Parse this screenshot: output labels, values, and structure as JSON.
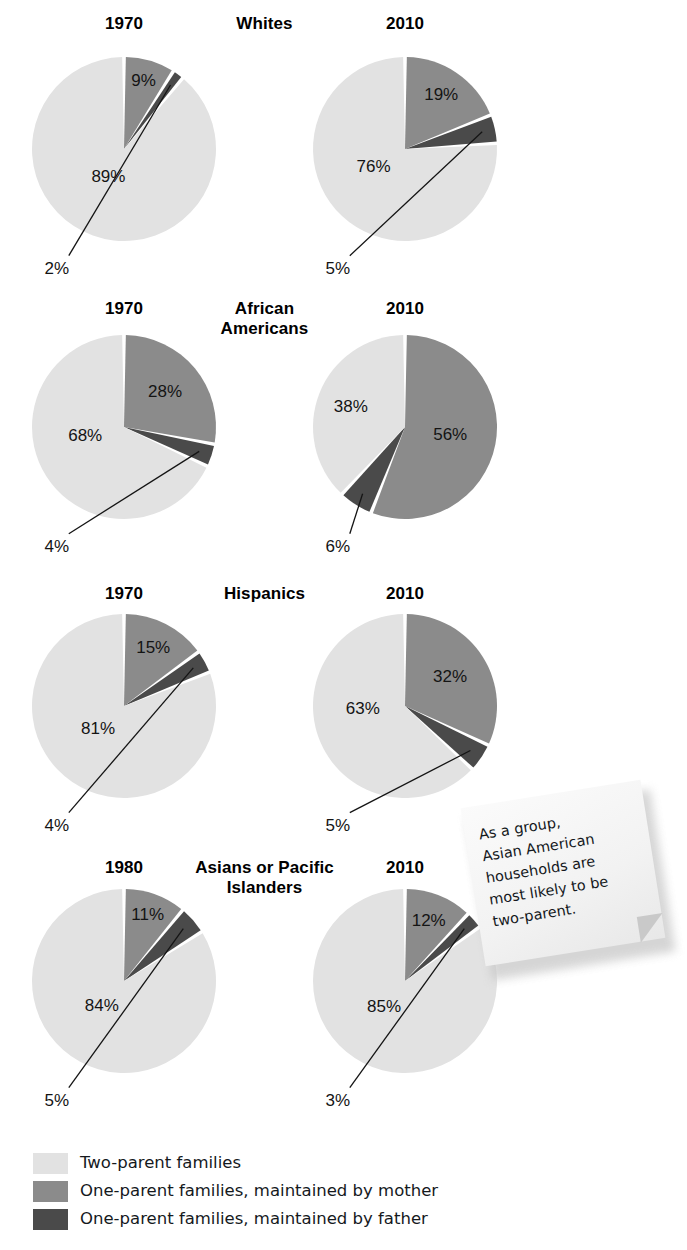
{
  "chart_data": {
    "type": "pie",
    "title": "",
    "legend_position": "bottom-left",
    "series_names": [
      "Two-parent families",
      "One-parent families, maintained by mother",
      "One-parent families, maintained by father"
    ],
    "colors": {
      "two_parent": "#e2e2e2",
      "mother": "#8b8b8b",
      "father": "#4a4a4a",
      "separator": "#ffffff",
      "text": "#141414"
    },
    "units": "percent",
    "rows": [
      {
        "group": "Whites",
        "charts": [
          {
            "year": "1970",
            "slices": [
              {
                "name": "Two-parent families",
                "value": 89,
                "label": "89%",
                "color_key": "two_parent",
                "callout": false
              },
              {
                "name": "One-parent families, maintained by mother",
                "value": 9,
                "label": "9%",
                "color_key": "mother",
                "callout": false
              },
              {
                "name": "One-parent families, maintained by father",
                "value": 2,
                "label": "2%",
                "color_key": "father",
                "callout": true
              }
            ]
          },
          {
            "year": "2010",
            "slices": [
              {
                "name": "Two-parent families",
                "value": 76,
                "label": "76%",
                "color_key": "two_parent",
                "callout": false
              },
              {
                "name": "One-parent families, maintained by mother",
                "value": 19,
                "label": "19%",
                "color_key": "mother",
                "callout": false
              },
              {
                "name": "One-parent families, maintained by father",
                "value": 5,
                "label": "5%",
                "color_key": "father",
                "callout": true
              }
            ]
          }
        ]
      },
      {
        "group": "African\nAmericans",
        "charts": [
          {
            "year": "1970",
            "slices": [
              {
                "name": "Two-parent families",
                "value": 68,
                "label": "68%",
                "color_key": "two_parent",
                "callout": false
              },
              {
                "name": "One-parent families, maintained by mother",
                "value": 28,
                "label": "28%",
                "color_key": "mother",
                "callout": false
              },
              {
                "name": "One-parent families, maintained by father",
                "value": 4,
                "label": "4%",
                "color_key": "father",
                "callout": true
              }
            ]
          },
          {
            "year": "2010",
            "slices": [
              {
                "name": "Two-parent families",
                "value": 38,
                "label": "38%",
                "color_key": "two_parent",
                "callout": false
              },
              {
                "name": "One-parent families, maintained by mother",
                "value": 56,
                "label": "56%",
                "color_key": "mother",
                "callout": false
              },
              {
                "name": "One-parent families, maintained by father",
                "value": 6,
                "label": "6%",
                "color_key": "father",
                "callout": true
              }
            ]
          }
        ]
      },
      {
        "group": "Hispanics",
        "charts": [
          {
            "year": "1970",
            "slices": [
              {
                "name": "Two-parent families",
                "value": 81,
                "label": "81%",
                "color_key": "two_parent",
                "callout": false
              },
              {
                "name": "One-parent families, maintained by mother",
                "value": 15,
                "label": "15%",
                "color_key": "mother",
                "callout": false
              },
              {
                "name": "One-parent families, maintained by father",
                "value": 4,
                "label": "4%",
                "color_key": "father",
                "callout": true
              }
            ]
          },
          {
            "year": "2010",
            "slices": [
              {
                "name": "Two-parent families",
                "value": 63,
                "label": "63%",
                "color_key": "two_parent",
                "callout": false
              },
              {
                "name": "One-parent families, maintained by mother",
                "value": 32,
                "label": "32%",
                "color_key": "mother",
                "callout": false
              },
              {
                "name": "One-parent families, maintained by father",
                "value": 5,
                "label": "5%",
                "color_key": "father",
                "callout": true
              }
            ]
          }
        ]
      },
      {
        "group": "Asians or Pacific\nIslanders",
        "charts": [
          {
            "year": "1980",
            "slices": [
              {
                "name": "Two-parent families",
                "value": 84,
                "label": "84%",
                "color_key": "two_parent",
                "callout": false
              },
              {
                "name": "One-parent families, maintained by mother",
                "value": 11,
                "label": "11%",
                "color_key": "mother",
                "callout": false
              },
              {
                "name": "One-parent families, maintained by father",
                "value": 5,
                "label": "5%",
                "color_key": "father",
                "callout": true
              }
            ]
          },
          {
            "year": "2010",
            "slices": [
              {
                "name": "Two-parent families",
                "value": 85,
                "label": "85%",
                "color_key": "two_parent",
                "callout": false
              },
              {
                "name": "One-parent families, maintained by mother",
                "value": 12,
                "label": "12%",
                "color_key": "mother",
                "callout": false
              },
              {
                "name": "One-parent families, maintained by father",
                "value": 3,
                "label": "3%",
                "color_key": "father",
                "callout": true
              }
            ]
          }
        ]
      }
    ]
  },
  "legend": {
    "items": [
      {
        "label": "Two-parent families",
        "color_key": "two_parent"
      },
      {
        "label": "One-parent families, maintained by mother",
        "color_key": "mother"
      },
      {
        "label": "One-parent families, maintained by father",
        "color_key": "father"
      }
    ]
  },
  "sticky_note": {
    "text": "As a group,\nAsian American\nhouseholds are\nmost likely to be\ntwo-parent."
  },
  "layout": {
    "row_tops": [
      14,
      299,
      584,
      858
    ],
    "pie_centers_y": [
      149,
      427,
      706,
      981
    ],
    "pie_cx_left": 124,
    "pie_cx_right": 405,
    "pie_radius": 92
  }
}
